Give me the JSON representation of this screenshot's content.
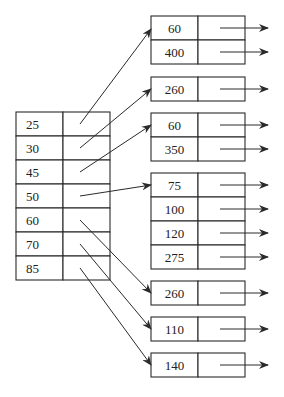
{
  "diagram": {
    "stroke_color": "#2a2a2a",
    "background": "#ffffff",
    "index_node": {
      "x": 16,
      "y": 112,
      "key_width": 47,
      "ptr_width": 47,
      "row_height": 24,
      "keys": [
        "25",
        "30",
        "45",
        "50",
        "60",
        "70",
        "85"
      ]
    },
    "leaf_nodes": [
      {
        "id": "leaf-1",
        "x": 151,
        "y": 16,
        "keys": [
          "60",
          "400"
        ]
      },
      {
        "id": "leaf-2",
        "x": 151,
        "y": 77,
        "keys": [
          "260"
        ]
      },
      {
        "id": "leaf-3",
        "x": 151,
        "y": 113,
        "keys": [
          "60",
          "350"
        ]
      },
      {
        "id": "leaf-4",
        "x": 151,
        "y": 173,
        "keys": [
          "75",
          "100",
          "120",
          "275"
        ]
      },
      {
        "id": "leaf-5",
        "x": 151,
        "y": 281,
        "keys": [
          "260"
        ]
      },
      {
        "id": "leaf-6",
        "x": 151,
        "y": 317,
        "keys": [
          "110"
        ]
      },
      {
        "id": "leaf-7",
        "x": 151,
        "y": 353,
        "keys": [
          "140"
        ]
      }
    ],
    "leaf_key_width": 47,
    "leaf_ptr_width": 47,
    "leaf_row_height": 24,
    "pointers": [
      {
        "from_row": 0,
        "to": [
          151,
          29
        ]
      },
      {
        "from_row": 1,
        "to": [
          151,
          89
        ]
      },
      {
        "from_row": 2,
        "to": [
          151,
          125
        ]
      },
      {
        "from_row": 3,
        "to": [
          151,
          185
        ]
      },
      {
        "from_row": 4,
        "to": [
          151,
          293
        ]
      },
      {
        "from_row": 5,
        "to": [
          151,
          329
        ]
      },
      {
        "from_row": 6,
        "to": [
          151,
          365
        ]
      }
    ],
    "outgoing_arrow": {
      "start_offset": 22,
      "end_x": 268
    }
  }
}
